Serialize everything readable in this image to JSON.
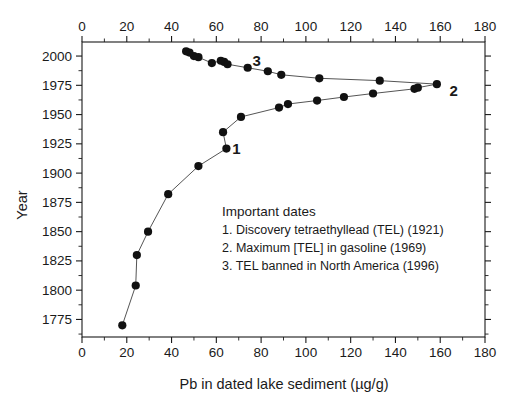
{
  "chart_data": {
    "type": "line",
    "title": "",
    "xlabel": "Pb in dated lake sediment (µg/g)",
    "ylabel": "Year",
    "xlim": [
      0,
      180
    ],
    "ylim": [
      1760,
      2012
    ],
    "grid": false,
    "x_major_ticks": [
      0,
      20,
      40,
      60,
      80,
      100,
      120,
      140,
      160,
      180
    ],
    "x_minor_ticks": [
      10,
      30,
      50,
      70,
      90,
      110,
      130,
      150,
      170
    ],
    "x_tick_labels": [
      "0",
      "20",
      "40",
      "60",
      "80",
      "100",
      "120",
      "140",
      "160",
      "180"
    ],
    "y_major_ticks": [
      2000,
      1975,
      1950,
      1925,
      1900,
      1875,
      1850,
      1825,
      1800,
      1775
    ],
    "y_tick_labels": [
      "2000",
      "1975",
      "1950",
      "1925",
      "1900",
      "1875",
      "1850",
      "1825",
      "1800",
      "1775"
    ],
    "x_axis_top": true,
    "x_axis_bottom": true,
    "series": [
      {
        "name": "Pb in dated lake sediment",
        "orientation": "x-is-value, y-is-year",
        "points": [
          {
            "pb": 18,
            "year": 1770
          },
          {
            "pb": 24,
            "year": 1804
          },
          {
            "pb": 24.5,
            "year": 1830
          },
          {
            "pb": 29.5,
            "year": 1850
          },
          {
            "pb": 38.5,
            "year": 1882
          },
          {
            "pb": 52,
            "year": 1906
          },
          {
            "pb": 64.5,
            "year": 1921
          },
          {
            "pb": 63,
            "year": 1935
          },
          {
            "pb": 71,
            "year": 1948
          },
          {
            "pb": 88,
            "year": 1956
          },
          {
            "pb": 92,
            "year": 1959
          },
          {
            "pb": 105,
            "year": 1962
          },
          {
            "pb": 117,
            "year": 1965
          },
          {
            "pb": 130,
            "year": 1968
          },
          {
            "pb": 148.5,
            "year": 1972
          },
          {
            "pb": 150,
            "year": 1973
          },
          {
            "pb": 158.5,
            "year": 1976
          },
          {
            "pb": 133,
            "year": 1979
          },
          {
            "pb": 106,
            "year": 1981
          },
          {
            "pb": 89,
            "year": 1984
          },
          {
            "pb": 83,
            "year": 1987
          },
          {
            "pb": 74,
            "year": 1990
          },
          {
            "pb": 65,
            "year": 1993
          },
          {
            "pb": 63.5,
            "year": 1995
          },
          {
            "pb": 62,
            "year": 1996
          },
          {
            "pb": 58,
            "year": 1994
          },
          {
            "pb": 52,
            "year": 1999
          },
          {
            "pb": 50,
            "year": 2000
          },
          {
            "pb": 48,
            "year": 2003
          },
          {
            "pb": 46.5,
            "year": 2004
          }
        ]
      }
    ],
    "annotations": [
      {
        "label": "1",
        "pb": 69,
        "year": 1921
      },
      {
        "label": "2",
        "pb": 166,
        "year": 1970
      },
      {
        "label": "3",
        "pb": 78,
        "year": 1996
      }
    ],
    "legend": {
      "position": "inside-center",
      "title": "Important dates",
      "entries": [
        "1. Discovery tetraethyllead (TEL) (1921)",
        "2. Maximum [TEL] in gasoline (1969)",
        "3. TEL banned in North America (1996)"
      ]
    },
    "colors": {
      "marker": "#111111",
      "line": "#555555",
      "axis": "#1a1a1a",
      "background": "#ffffff"
    }
  },
  "caption": {
    "text": ""
  }
}
